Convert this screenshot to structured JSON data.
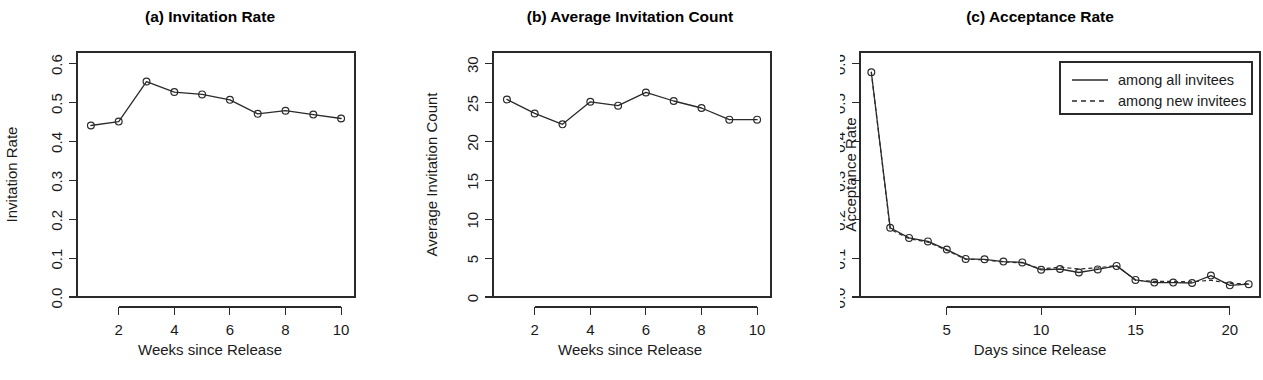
{
  "figure": {
    "background": "#ffffff",
    "foreground": "#2a2a2a",
    "panel_count": 3
  },
  "chart_data": [
    {
      "id": "a",
      "type": "line",
      "title": "(a) Invitation Rate",
      "xlabel": "Weeks since Release",
      "ylabel": "Invitation Rate",
      "xlim": [
        0.5,
        10.5
      ],
      "ylim": [
        0.0,
        0.63
      ],
      "xticks": [
        2,
        4,
        6,
        8,
        10
      ],
      "xtick_labels": [
        "2",
        "4",
        "6",
        "8",
        "10"
      ],
      "yticks": [
        0.0,
        0.1,
        0.2,
        0.3,
        0.4,
        0.5,
        0.6
      ],
      "ytick_labels": [
        "0.0",
        "0.1",
        "0.2",
        "0.3",
        "0.4",
        "0.5",
        "0.6"
      ],
      "grid": false,
      "legend": null,
      "x": [
        1,
        2,
        3,
        4,
        5,
        6,
        7,
        8,
        9,
        10
      ],
      "series": [
        {
          "name": "invitation rate",
          "style": "solid",
          "marker": "circle",
          "values": [
            0.441,
            0.451,
            0.554,
            0.527,
            0.521,
            0.507,
            0.471,
            0.479,
            0.469,
            0.459
          ]
        }
      ]
    },
    {
      "id": "b",
      "type": "line",
      "title": "(b) Average Invitation Count",
      "xlabel": "Weeks since Release",
      "ylabel": "Average Invitation Count",
      "xlim": [
        0.5,
        10.5
      ],
      "ylim": [
        0,
        31.5
      ],
      "xticks": [
        2,
        4,
        6,
        8,
        10
      ],
      "xtick_labels": [
        "2",
        "4",
        "6",
        "8",
        "10"
      ],
      "yticks": [
        0,
        5,
        10,
        15,
        20,
        25,
        30
      ],
      "ytick_labels": [
        "0",
        "5",
        "10",
        "15",
        "20",
        "25",
        "30"
      ],
      "grid": false,
      "legend": null,
      "x": [
        1,
        2,
        3,
        4,
        5,
        6,
        7,
        8,
        9,
        10
      ],
      "series": [
        {
          "name": "average invitation count",
          "style": "solid",
          "marker": "circle",
          "values": [
            25.4,
            23.6,
            22.2,
            25.1,
            24.6,
            26.3,
            25.2,
            24.3,
            22.8,
            22.8
          ]
        }
      ]
    },
    {
      "id": "c",
      "type": "line",
      "title": "(c) Acceptance Rate",
      "xlabel": "Days since Release",
      "ylabel": "Acceptance Rate",
      "xlim": [
        0.4,
        21.6
      ],
      "ylim": [
        0.0,
        0.63
      ],
      "xticks": [
        5,
        10,
        15,
        20
      ],
      "xtick_labels": [
        "5",
        "10",
        "15",
        "20"
      ],
      "yticks": [
        0.0,
        0.1,
        0.2,
        0.3,
        0.4,
        0.5,
        0.6
      ],
      "ytick_labels": [
        "0.0",
        "0.1",
        "0.2",
        "0.3",
        "0.4",
        "0.5",
        "0.6"
      ],
      "grid": false,
      "legend": {
        "position": "top-right",
        "entries": [
          {
            "label": "among all invitees",
            "style": "solid"
          },
          {
            "label": "among new invitees",
            "style": "dashed"
          }
        ]
      },
      "x": [
        1,
        2,
        3,
        4,
        5,
        6,
        7,
        8,
        9,
        10,
        11,
        12,
        13,
        14,
        15,
        16,
        17,
        18,
        19,
        20,
        21
      ],
      "series": [
        {
          "name": "among all invitees",
          "style": "solid",
          "marker": "circle",
          "values": [
            0.578,
            0.178,
            0.152,
            0.143,
            0.122,
            0.098,
            0.097,
            0.091,
            0.089,
            0.07,
            0.072,
            0.063,
            0.071,
            0.08,
            0.044,
            0.037,
            0.037,
            0.036,
            0.055,
            0.03,
            0.033
          ]
        },
        {
          "name": "among new invitees",
          "style": "dashed",
          "marker": "circle",
          "values": [
            0.578,
            0.174,
            0.15,
            0.141,
            0.12,
            0.097,
            0.096,
            0.09,
            0.088,
            0.072,
            0.077,
            0.072,
            0.075,
            0.081,
            0.043,
            0.04,
            0.04,
            0.039,
            0.043,
            0.035,
            0.034
          ]
        }
      ]
    }
  ]
}
